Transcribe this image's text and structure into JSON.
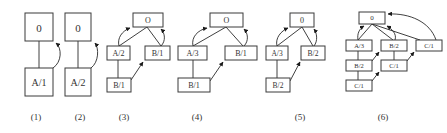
{
  "diagrams": [
    {
      "caption": "(1)",
      "nodes": [
        {
          "id": "o",
          "label": "0"
        },
        {
          "id": "a",
          "label": "A/1"
        }
      ]
    },
    {
      "caption": "(2)",
      "nodes": [
        {
          "id": "o",
          "label": "0"
        },
        {
          "id": "a",
          "label": "A/2"
        }
      ]
    },
    {
      "caption": "(3)",
      "nodes": [
        {
          "id": "o",
          "label": "O"
        },
        {
          "id": "a",
          "label": "A/2"
        },
        {
          "id": "b",
          "label": "B/1"
        },
        {
          "id": "b2",
          "label": "B/1"
        }
      ]
    },
    {
      "caption": "(4)",
      "nodes": [
        {
          "id": "o",
          "label": "O"
        },
        {
          "id": "a",
          "label": "A/3"
        },
        {
          "id": "b",
          "label": "B/1"
        },
        {
          "id": "b2",
          "label": "B/1"
        }
      ]
    },
    {
      "caption": "(5)",
      "nodes": [
        {
          "id": "o",
          "label": "0"
        },
        {
          "id": "a",
          "label": "A/3"
        },
        {
          "id": "b",
          "label": "B/2"
        },
        {
          "id": "b2",
          "label": "B/2"
        }
      ]
    },
    {
      "caption": "(6)",
      "nodes": [
        {
          "id": "o",
          "label": "0"
        },
        {
          "id": "a",
          "label": "A/3"
        },
        {
          "id": "b",
          "label": "B/2"
        },
        {
          "id": "c",
          "label": "C/1"
        },
        {
          "id": "b2",
          "label": "B/2"
        },
        {
          "id": "c2",
          "label": "C/1"
        },
        {
          "id": "c3",
          "label": "C/1"
        }
      ]
    }
  ],
  "colors": {
    "stroke": "#3a3a3a",
    "text": "#333333",
    "background": "#ffffff"
  }
}
